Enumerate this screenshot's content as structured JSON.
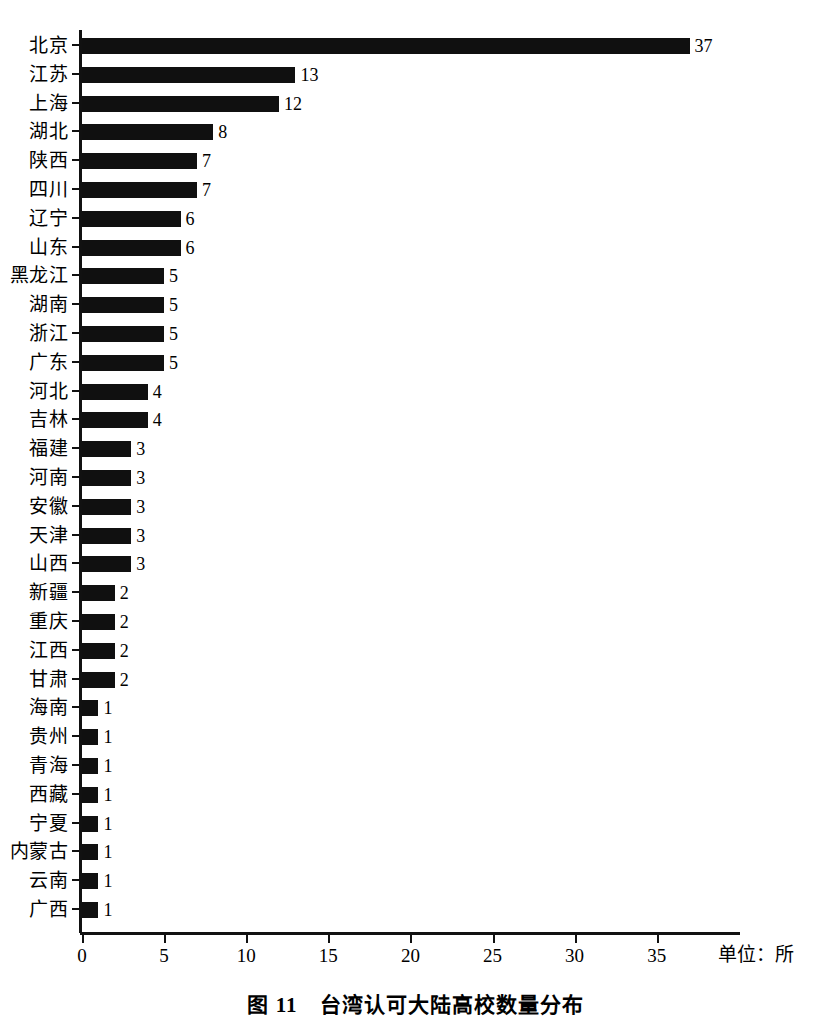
{
  "chart_data": {
    "type": "bar",
    "orientation": "horizontal",
    "title": "图 11　台湾认可大陆高校数量分布",
    "caption_prefix": "图 11",
    "caption_text": "台湾认可大陆高校数量分布",
    "xlabel": "单位：所",
    "ylabel": "",
    "xlim": [
      0,
      40
    ],
    "x_ticks": [
      0,
      5,
      10,
      15,
      20,
      25,
      30,
      35
    ],
    "x_tick_labels": [
      "0",
      "5",
      "10",
      "15",
      "20",
      "25",
      "30",
      "35"
    ],
    "grid": false,
    "legend": false,
    "bar_color": "#101010",
    "axis_color": "#111111",
    "background": "#ffffff",
    "categories": [
      "北京",
      "江苏",
      "上海",
      "湖北",
      "陕西",
      "四川",
      "辽宁",
      "山东",
      "黑龙江",
      "湖南",
      "浙江",
      "广东",
      "河北",
      "吉林",
      "福建",
      "河南",
      "安徽",
      "天津",
      "山西",
      "新疆",
      "重庆",
      "江西",
      "甘肃",
      "海南",
      "贵州",
      "青海",
      "西藏",
      "宁夏",
      "内蒙古",
      "云南",
      "广西"
    ],
    "values": [
      37,
      13,
      12,
      8,
      7,
      7,
      6,
      6,
      5,
      5,
      5,
      5,
      4,
      4,
      3,
      3,
      3,
      3,
      3,
      2,
      2,
      2,
      2,
      1,
      1,
      1,
      1,
      1,
      1,
      1,
      1
    ],
    "value_labels": [
      "37",
      "13",
      "12",
      "8",
      "7",
      "7",
      "6",
      "6",
      "5",
      "5",
      "5",
      "5",
      "4",
      "4",
      "3",
      "3",
      "3",
      "3",
      "3",
      "2",
      "2",
      "2",
      "2",
      "1",
      "1",
      "1",
      "1",
      "1",
      "1",
      "1",
      "1"
    ]
  }
}
